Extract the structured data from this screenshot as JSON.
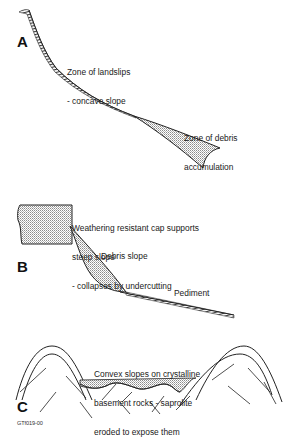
{
  "figure": {
    "code": "GTf019-00",
    "colors": {
      "line": "#222222",
      "stipple": "#9a9a9a",
      "background": "#ffffff"
    },
    "panels": [
      {
        "id": "A",
        "label": "A",
        "annotations": [
          {
            "line1": "Zone of landslips",
            "line2": "- concave slope"
          },
          {
            "line1": "Zone of debris",
            "line2": "accumulation"
          }
        ]
      },
      {
        "id": "B",
        "label": "B",
        "annotations": [
          {
            "line1": "Weathering resistant cap supports",
            "line2": "steep slope",
            "line3": "- collapses by undercutting"
          },
          {
            "line1": "Debris slope"
          },
          {
            "line1": "Pediment"
          }
        ]
      },
      {
        "id": "C",
        "label": "C",
        "annotations": [
          {
            "line1": "Convex slopes on crystalline",
            "line2": "basement rocks - saprolite",
            "line3": "eroded to expose them"
          }
        ]
      }
    ]
  }
}
